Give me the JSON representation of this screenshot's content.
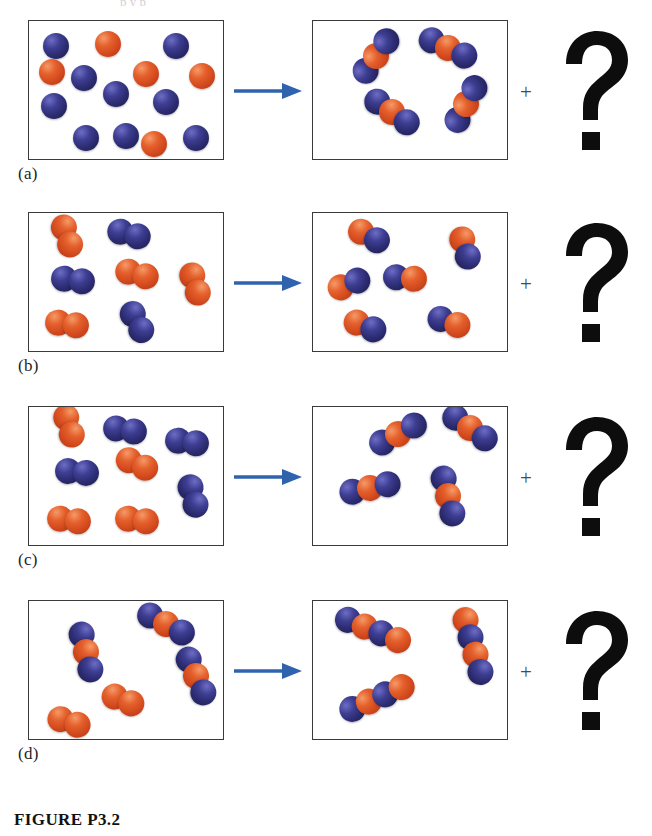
{
  "figure": {
    "caption": "FIGURE P3.2",
    "top_cut_text": "p        y    p",
    "plus_symbol": "+",
    "unknown_symbol": "?"
  },
  "colors": {
    "blue_atom": "#2b2b70",
    "red_atom": "#d2481d",
    "arrow": "#2f63ad",
    "box_border": "#3a3a3a",
    "background": "#ffffff",
    "question_mark": "#0d0d0d"
  },
  "panels": [
    {
      "label": "(a)",
      "reactants": {
        "description": "loose single atoms",
        "blue_atoms": 9,
        "red_atoms": 5,
        "molecules": []
      },
      "products": {
        "description": "four blue-red-blue triatomic molecules",
        "molecule_count": 4,
        "molecule_pattern": "blue-red-blue"
      },
      "unknown": "?"
    },
    {
      "label": "(b)",
      "reactants": {
        "description": "red diatomic and blue diatomic molecules",
        "red_diatomic": 4,
        "blue_diatomic": 3,
        "molecule_count": 7
      },
      "products": {
        "description": "six red-blue diatomic molecules",
        "molecule_count": 6,
        "molecule_pattern": "red-blue"
      },
      "unknown": "?"
    },
    {
      "label": "(c)",
      "reactants": {
        "description": "red diatomic and blue diatomic molecules",
        "red_diatomic": 4,
        "blue_diatomic": 4,
        "molecule_count": 8
      },
      "products": {
        "description": "four blue-red-blue triatomic molecules",
        "molecule_count": 4,
        "molecule_pattern": "blue-red-blue"
      },
      "unknown": "?"
    },
    {
      "label": "(d)",
      "reactants": {
        "description": "blue-red-blue triatomic molecules and red diatomic molecules",
        "triatomic_count": 4,
        "red_diatomic": 2,
        "molecule_count": 6
      },
      "products": {
        "description": "three blue-red-blue-red tetratomic molecules",
        "molecule_count": 3,
        "molecule_pattern": "blue-red-blue-red"
      },
      "unknown": "?"
    }
  ],
  "atom_layout": {
    "a_left": [
      {
        "c": "blue",
        "x": 14,
        "y": 12
      },
      {
        "c": "red",
        "x": 66,
        "y": 10
      },
      {
        "c": "blue",
        "x": 134,
        "y": 12
      },
      {
        "c": "blue",
        "x": 42,
        "y": 44
      },
      {
        "c": "red",
        "x": 104,
        "y": 40
      },
      {
        "c": "red",
        "x": 160,
        "y": 42
      },
      {
        "c": "blue",
        "x": 12,
        "y": 72
      },
      {
        "c": "blue",
        "x": 74,
        "y": 60
      },
      {
        "c": "blue",
        "x": 124,
        "y": 68
      },
      {
        "c": "blue",
        "x": 44,
        "y": 104
      },
      {
        "c": "blue",
        "x": 84,
        "y": 102
      },
      {
        "c": "red",
        "x": 112,
        "y": 110
      },
      {
        "c": "blue",
        "x": 154,
        "y": 104
      },
      {
        "c": "red",
        "x": 10,
        "y": 38
      }
    ],
    "a_right": [
      {
        "rot": -55,
        "x": 32,
        "y": 22,
        "pat": "brb"
      },
      {
        "rot": 25,
        "x": 104,
        "y": 14,
        "pat": "brb"
      },
      {
        "rot": 35,
        "x": 48,
        "y": 78,
        "pat": "brb"
      },
      {
        "rot": -62,
        "x": 122,
        "y": 70,
        "pat": "brb"
      }
    ],
    "b_left": [
      {
        "rot": 70,
        "x": 16,
        "y": 10,
        "pat": "rr"
      },
      {
        "rot": 15,
        "x": 78,
        "y": 8,
        "pat": "bb"
      },
      {
        "rot": 8,
        "x": 22,
        "y": 54,
        "pat": "bb"
      },
      {
        "rot": 15,
        "x": 86,
        "y": 48,
        "pat": "rr"
      },
      {
        "rot": 72,
        "x": 144,
        "y": 58,
        "pat": "rr"
      },
      {
        "rot": 8,
        "x": 16,
        "y": 98,
        "pat": "rr"
      },
      {
        "rot": 62,
        "x": 86,
        "y": 96,
        "pat": "bb"
      }
    ],
    "b_right": [
      {
        "rot": 28,
        "x": 34,
        "y": 10,
        "pat": "rb"
      },
      {
        "rot": 72,
        "x": 130,
        "y": 22,
        "pat": "rb"
      },
      {
        "rot": -22,
        "x": 14,
        "y": 58,
        "pat": "rb"
      },
      {
        "rot": 5,
        "x": 70,
        "y": 52,
        "pat": "br"
      },
      {
        "rot": 22,
        "x": 30,
        "y": 100,
        "pat": "rb"
      },
      {
        "rot": 20,
        "x": 114,
        "y": 96,
        "pat": "br"
      }
    ],
    "c_left": [
      {
        "rot": 72,
        "x": 18,
        "y": 6,
        "pat": "rr"
      },
      {
        "rot": 10,
        "x": 74,
        "y": 10,
        "pat": "bb"
      },
      {
        "rot": 8,
        "x": 136,
        "y": 22,
        "pat": "bb"
      },
      {
        "rot": 6,
        "x": 26,
        "y": 52,
        "pat": "bb"
      },
      {
        "rot": 25,
        "x": 86,
        "y": 44,
        "pat": "rr"
      },
      {
        "rot": 74,
        "x": 142,
        "y": 76,
        "pat": "bb"
      },
      {
        "rot": 8,
        "x": 18,
        "y": 100,
        "pat": "rr"
      },
      {
        "rot": 8,
        "x": 86,
        "y": 100,
        "pat": "rr"
      }
    ],
    "c_right": [
      {
        "rot": -28,
        "x": 54,
        "y": 14,
        "pat": "brb"
      },
      {
        "rot": 35,
        "x": 126,
        "y": 8,
        "pat": "brb"
      },
      {
        "rot": -12,
        "x": 26,
        "y": 68,
        "pat": "brb"
      },
      {
        "rot": 76,
        "x": 104,
        "y": 76,
        "pat": "brb"
      }
    ],
    "d_left": [
      {
        "rot": 76,
        "x": 26,
        "y": 38,
        "pat": "brb"
      },
      {
        "rot": 28,
        "x": 106,
        "y": 10,
        "pat": "brb"
      },
      {
        "rot": 66,
        "x": 136,
        "y": 62,
        "pat": "brb"
      },
      {
        "rot": 22,
        "x": 72,
        "y": 86,
        "pat": "rr"
      },
      {
        "rot": 18,
        "x": 18,
        "y": 108,
        "pat": "rr"
      }
    ],
    "d_right": [
      {
        "rot": 22,
        "x": 20,
        "y": 16,
        "pat": "brbr"
      },
      {
        "rot": 74,
        "x": 120,
        "y": 32,
        "pat": "rbrb"
      },
      {
        "rot": -24,
        "x": 24,
        "y": 84,
        "pat": "brbr"
      }
    ]
  }
}
